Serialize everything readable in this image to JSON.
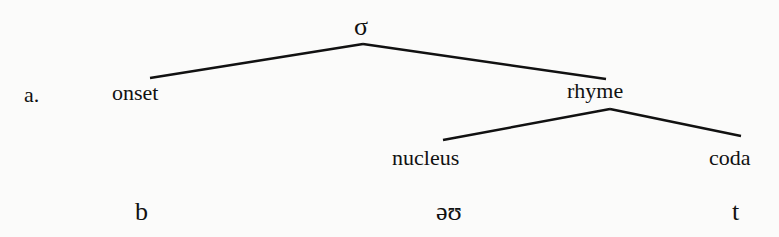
{
  "diagram": {
    "type": "syllable-structure-tree",
    "example_label": "a.",
    "root": {
      "label": "σ",
      "x": 362,
      "y": 15
    },
    "nodes": [
      {
        "id": "onset",
        "label": "onset",
        "x": 112,
        "y": 81
      },
      {
        "id": "rhyme",
        "label": "rhyme",
        "x": 567,
        "y": 81
      },
      {
        "id": "nucleus",
        "label": "nucleus",
        "x": 392,
        "y": 147
      },
      {
        "id": "coda",
        "label": "coda",
        "x": 709,
        "y": 147
      }
    ],
    "segments": [
      {
        "id": "seg-b",
        "label": "b",
        "x": 135,
        "y": 200
      },
      {
        "id": "seg-ou",
        "label": "əʊ",
        "x": 436,
        "y": 200
      },
      {
        "id": "seg-t",
        "label": "t",
        "x": 732,
        "y": 200
      }
    ],
    "edges": [
      {
        "from": "σ",
        "to": "onset",
        "x1": 363,
        "y1": 44,
        "x2": 150,
        "y2": 78
      },
      {
        "from": "σ",
        "to": "rhyme",
        "x1": 363,
        "y1": 44,
        "x2": 606,
        "y2": 79
      },
      {
        "from": "rhyme",
        "to": "nucleus",
        "x1": 610,
        "y1": 109,
        "x2": 443,
        "y2": 140
      },
      {
        "from": "rhyme",
        "to": "coda",
        "x1": 610,
        "y1": 109,
        "x2": 741,
        "y2": 136
      }
    ],
    "line_color": "#111111"
  }
}
